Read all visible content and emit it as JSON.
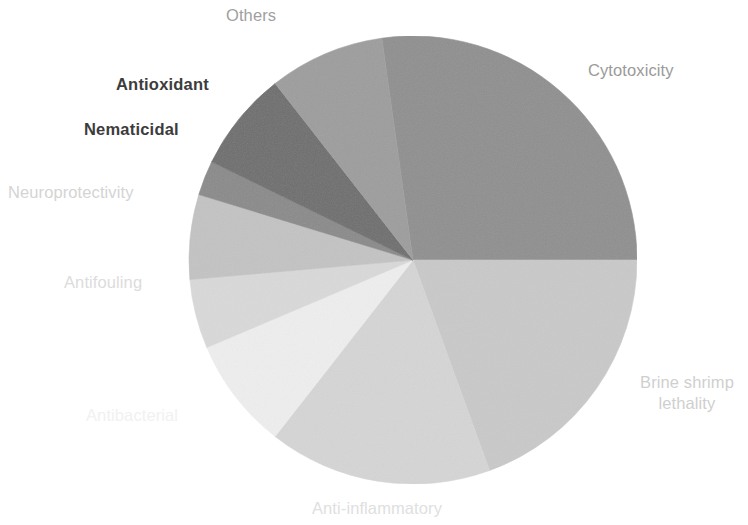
{
  "chart_data": {
    "type": "pie",
    "title": "",
    "subtitle": "",
    "legend_position": "outside-labels",
    "grid": false,
    "categories": [
      "Cytotoxicity",
      "Brine shrimp lethality",
      "Anti-inflammatory",
      "Antibacterial",
      "Antifouling",
      "Neuroprotectivity",
      "Nematicidal",
      "Antioxidant",
      "Others"
    ],
    "values": [
      27.8,
      19.4,
      16.1,
      8.1,
      5.0,
      6.1,
      2.5,
      7.2,
      8.3
    ],
    "slices": [
      {
        "label": "Cytotoxicity",
        "value": 27.8,
        "start_angle": 352,
        "end_angle": 90,
        "color": "#8f8f8f",
        "label_color": "#9a9a9a",
        "emphasis": "normal"
      },
      {
        "label": "Brine shrimp\nlethality",
        "value": 19.4,
        "start_angle": 90,
        "end_angle": 160,
        "color": "#c9c9c9",
        "label_color": "#cfcfcf",
        "emphasis": "normal"
      },
      {
        "label": "Anti-inflammatory",
        "value": 16.1,
        "start_angle": 160,
        "end_angle": 218,
        "color": "#d5d5d5",
        "label_color": "#e0e0e0",
        "emphasis": "normal"
      },
      {
        "label": "Antibacterial",
        "value": 8.1,
        "start_angle": 218,
        "end_angle": 247,
        "color": "#eeeeee",
        "label_color": "#f1f1f1",
        "emphasis": "normal"
      },
      {
        "label": "Antifouling",
        "value": 5.0,
        "start_angle": 247,
        "end_angle": 265,
        "color": "#d9d9d9",
        "label_color": "#dcdcdc",
        "emphasis": "normal"
      },
      {
        "label": "Neuroprotectivity",
        "value": 6.1,
        "start_angle": 265,
        "end_angle": 287,
        "color": "#c3c3c3",
        "label_color": "#d4d4d4",
        "emphasis": "normal"
      },
      {
        "label": "Nematicidal",
        "value": 2.5,
        "start_angle": 287,
        "end_angle": 296,
        "color": "#8a8a8a",
        "label_color": "#3c3c3c",
        "emphasis": "bold"
      },
      {
        "label": "Antioxidant",
        "value": 7.2,
        "start_angle": 296,
        "end_angle": 322,
        "color": "#6e6e6e",
        "label_color": "#3c3c3c",
        "emphasis": "bold"
      },
      {
        "label": "Others",
        "value": 8.3,
        "start_angle": 322,
        "end_angle": 352,
        "color": "#9d9d9d",
        "label_color": "#9f9f9f",
        "emphasis": "normal"
      }
    ],
    "geometry": {
      "cx": 413,
      "cy": 260,
      "r": 224
    }
  },
  "labels": {
    "cytotoxicity": "Cytotoxicity",
    "brine_shrimp_lethality": "Brine shrimp\nlethality",
    "anti_inflammatory": "Anti-inflammatory",
    "antibacterial": "Antibacterial",
    "antifouling": "Antifouling",
    "neuroprotectivity": "Neuroprotectivity",
    "nematicidal": "Nematicidal",
    "antioxidant": "Antioxidant",
    "others": "Others"
  },
  "colors": {
    "background": "#ffffff",
    "cytotoxicity": "#8f8f8f",
    "brine_shrimp_lethality": "#c9c9c9",
    "anti_inflammatory": "#d5d5d5",
    "antibacterial": "#eeeeee",
    "antifouling": "#d9d9d9",
    "neuroprotectivity": "#c3c3c3",
    "nematicidal": "#8a8a8a",
    "antioxidant": "#6e6e6e",
    "others": "#9d9d9d",
    "bold_label_text": "#3c3c3c"
  }
}
